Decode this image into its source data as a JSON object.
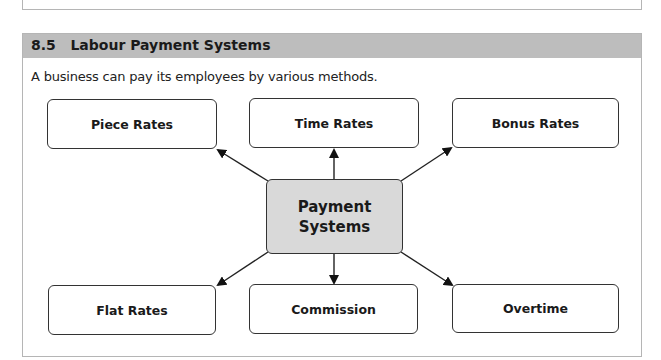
{
  "section": {
    "title": "8.5   Labour Payment Systems",
    "intro": "A business can pay its employees by various methods."
  },
  "diagram": {
    "center": {
      "line1": "Payment",
      "line2": "Systems"
    },
    "nodes": {
      "piece_rates": "Piece Rates",
      "time_rates": "Time Rates",
      "bonus_rates": "Bonus Rates",
      "flat_rates": "Flat Rates",
      "commission": "Commission",
      "overtime": "Overtime"
    },
    "colors": {
      "header": "#bdbdbd",
      "center_fill": "#d9d9d9",
      "border": "#333333"
    }
  }
}
